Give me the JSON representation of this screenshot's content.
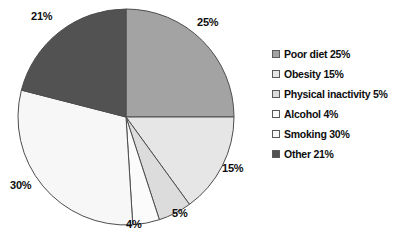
{
  "chart_data": {
    "type": "pie",
    "title": "",
    "subtitle": "",
    "xlabel": "",
    "ylabel": "",
    "grid": false,
    "legend_position": "right",
    "start_angle_deg": 0,
    "direction": "clockwise",
    "categories": [
      "Poor diet",
      "Obesity",
      "Physical inactivity",
      "Alcohol",
      "Smoking",
      "Other"
    ],
    "values": [
      25,
      15,
      5,
      4,
      30,
      21
    ],
    "value_unit": "%",
    "slices": [
      {
        "name": "Poor diet",
        "value": 25,
        "label": "25%",
        "legend_label": "Poor diet 25%",
        "color": "#a3a3a3",
        "start_deg": 0,
        "end_deg": 90,
        "label_x": 197,
        "label_y": 17
      },
      {
        "name": "Obesity",
        "value": 15,
        "label": "15%",
        "legend_label": "Obesity 15%",
        "color": "#e6e6e6",
        "start_deg": 90,
        "end_deg": 144,
        "label_x": 222,
        "label_y": 163
      },
      {
        "name": "Physical inactivity",
        "value": 5,
        "label": "5%",
        "legend_label": "Physical inactivity 5%",
        "color": "#dcdcdc",
        "start_deg": 144,
        "end_deg": 162,
        "label_x": 172,
        "label_y": 208
      },
      {
        "name": "Alcohol",
        "value": 4,
        "label": "4%",
        "legend_label": "Alcohol 4%",
        "color": "#fbfbfb",
        "start_deg": 162,
        "end_deg": 176.4,
        "label_x": 126,
        "label_y": 219
      },
      {
        "name": "Smoking",
        "value": 30,
        "label": "30%",
        "legend_label": "Smoking 30%",
        "color": "#f7f7f7",
        "start_deg": 176.4,
        "end_deg": 284.4,
        "label_x": 10,
        "label_y": 180
      },
      {
        "name": "Other",
        "value": 21,
        "label": "21%",
        "legend_label": "Other 21%",
        "color": "#525252",
        "start_deg": 284.4,
        "end_deg": 360,
        "label_x": 31,
        "label_y": 11
      }
    ]
  },
  "geometry": {
    "cx": 126,
    "cy": 117,
    "r": 108,
    "stroke": "#4d4d4d",
    "stroke_width": 1
  },
  "legend": {
    "items": [
      {
        "label": "Poor diet 25%",
        "color": "#a3a3a3"
      },
      {
        "label": "Obesity 15%",
        "color": "#e6e6e6"
      },
      {
        "label": "Physical inactivity 5%",
        "color": "#dcdcdc"
      },
      {
        "label": "Alcohol 4%",
        "color": "#fbfbfb"
      },
      {
        "label": "Smoking 30%",
        "color": "#f7f7f7"
      },
      {
        "label": "Other 21%",
        "color": "#525252"
      }
    ]
  }
}
